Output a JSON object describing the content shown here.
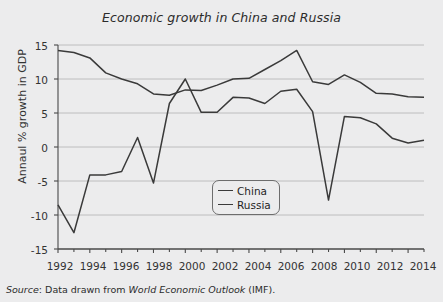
{
  "figure": {
    "title": "Economic growth in China and Russia",
    "source_prefix": "Source",
    "source_text": ": Data drawn from ",
    "source_italic": "World Economic Outlook",
    "source_suffix": " (IMF)."
  },
  "colors": {
    "background": "#ececed",
    "line": "#3a3a3a",
    "gridline": "#b9b9b9",
    "axis": "#4a4a4a",
    "text": "#2b2b2b"
  },
  "legend": {
    "position": "inside-center",
    "items": [
      {
        "label": "China",
        "color": "#3a3a3a"
      },
      {
        "label": "Russia",
        "color": "#3a3a3a"
      }
    ]
  },
  "chart_data": {
    "type": "line",
    "title": "Economic growth in China and Russia",
    "xlabel": "",
    "ylabel": "Annaul % growth in GDP",
    "xlim": [
      1992,
      2015
    ],
    "ylim": [
      -15,
      15
    ],
    "grid": true,
    "ytick_labels": [
      "15",
      "10",
      "5",
      "0",
      "-5",
      "-10",
      "-15"
    ],
    "ytick_values": [
      15,
      10,
      5,
      0,
      -5,
      -10,
      -15
    ],
    "xtick_labels": [
      "1992",
      "1994",
      "1996",
      "1998",
      "2000",
      "2002",
      "2004",
      "2006",
      "2008",
      "2010",
      "2012",
      "2014"
    ],
    "xtick_values": [
      1992,
      1994,
      1996,
      1998,
      2000,
      2002,
      2004,
      2006,
      2008,
      2010,
      2012,
      2014
    ],
    "x": [
      1992,
      1993,
      1994,
      1995,
      1996,
      1997,
      1998,
      1999,
      2000,
      2001,
      2002,
      2003,
      2004,
      2005,
      2006,
      2007,
      2008,
      2009,
      2010,
      2011,
      2012,
      2013,
      2014,
      2015
    ],
    "series": [
      {
        "name": "China",
        "values": [
          14.2,
          13.9,
          13.1,
          10.9,
          10.0,
          9.3,
          7.8,
          7.6,
          8.4,
          8.3,
          9.1,
          10.0,
          10.1,
          11.4,
          12.7,
          14.2,
          9.6,
          9.2,
          10.6,
          9.5,
          7.9,
          7.8,
          7.4,
          7.3
        ]
      },
      {
        "name": "Russia",
        "values": [
          -8.5,
          -12.6,
          -4.1,
          -4.1,
          -3.6,
          1.4,
          -5.3,
          6.4,
          10.0,
          5.1,
          5.1,
          7.3,
          7.2,
          6.4,
          8.2,
          8.5,
          5.2,
          -7.8,
          4.5,
          4.3,
          3.4,
          1.3,
          0.6,
          1.0
        ]
      }
    ]
  }
}
